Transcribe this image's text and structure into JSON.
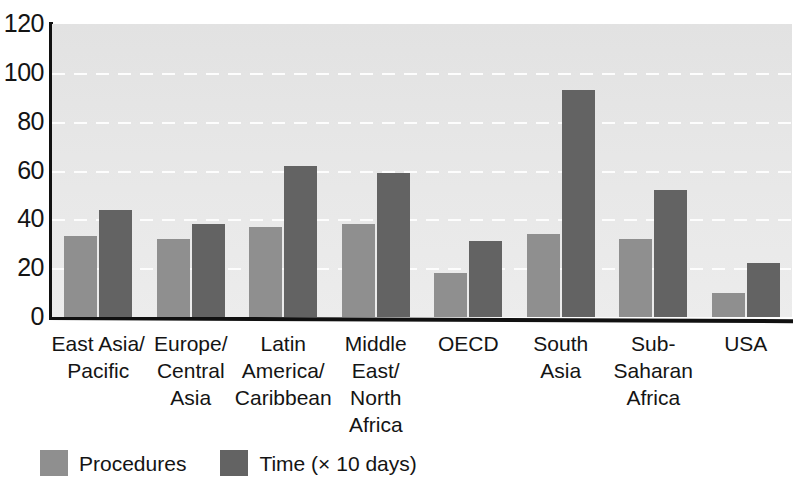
{
  "chart_data": {
    "type": "bar",
    "title": "",
    "subtitle": "",
    "xlabel": "",
    "ylabel": "",
    "ylim": [
      0,
      120
    ],
    "ytick_values": [
      0,
      20,
      40,
      60,
      80,
      100,
      120
    ],
    "ytick_labels": [
      "0",
      "20",
      "40",
      "60",
      "80",
      "100",
      "120"
    ],
    "grid": true,
    "grid_axis": "y",
    "legend_position": "bottom-left",
    "categories": [
      "East Asia/\nPacific",
      "Europe/\nCentral\nAsia",
      "Latin\nAmerica/\nCaribbean",
      "Middle\nEast/\nNorth\nAfrica",
      "OECD",
      "South\nAsia",
      "Sub-\nSaharan\nAfrica",
      "USA"
    ],
    "series": [
      {
        "name": "Procedures",
        "color": "#8f8f8f",
        "values": [
          33,
          32,
          37,
          38,
          18,
          34,
          32,
          10
        ]
      },
      {
        "name": "Time (× 10 days)",
        "color": "#636363",
        "values": [
          44,
          38,
          62,
          59,
          31,
          93,
          52,
          22
        ]
      }
    ]
  },
  "axis": {
    "ticks": [
      {
        "label": "120",
        "value": 120
      },
      {
        "label": "100",
        "value": 100
      },
      {
        "label": "80",
        "value": 80
      },
      {
        "label": "60",
        "value": 60
      },
      {
        "label": "40",
        "value": 40
      },
      {
        "label": "20",
        "value": 20
      },
      {
        "label": "0",
        "value": 0
      }
    ]
  },
  "categories": [
    {
      "id": "east-asia-pacific",
      "lines": [
        "East Asia/",
        "Pacific"
      ]
    },
    {
      "id": "europe-central-asia",
      "lines": [
        "Europe/",
        "Central",
        "Asia"
      ]
    },
    {
      "id": "latin-america-caribbean",
      "lines": [
        "Latin",
        "America/",
        "Caribbean"
      ]
    },
    {
      "id": "middle-east-north-africa",
      "lines": [
        "Middle",
        "East/",
        "North",
        "Africa"
      ]
    },
    {
      "id": "oecd",
      "lines": [
        "OECD"
      ]
    },
    {
      "id": "south-asia",
      "lines": [
        "South",
        "Asia"
      ]
    },
    {
      "id": "sub-saharan-africa",
      "lines": [
        "Sub-",
        "Saharan",
        "Africa"
      ]
    },
    {
      "id": "usa",
      "lines": [
        "USA"
      ]
    }
  ],
  "legend": {
    "items": [
      {
        "label": "Procedures",
        "color": "#8f8f8f",
        "swatch": "procedures"
      },
      {
        "label": "Time (× 10 days)",
        "color": "#636363",
        "swatch": "time"
      }
    ]
  },
  "colors": {
    "procedures": "#8f8f8f",
    "time": "#636363",
    "plot_background": "#e8e8e8",
    "gridline": "#fdfdfd",
    "axis": "#111111",
    "text": "#141414"
  }
}
